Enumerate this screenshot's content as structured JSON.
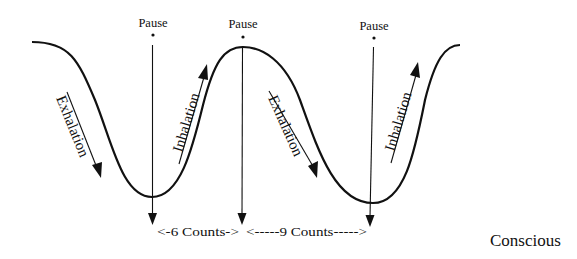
{
  "diagram": {
    "type": "breathing-waveform",
    "caption": "Conscious",
    "pause_labels": [
      "Pause",
      "Pause",
      "Pause"
    ],
    "phase_labels": {
      "exhalation_1": "Exhalation",
      "inhalation_1": "Inhalation",
      "exhalation_2": "Exhalation",
      "inhalation_2": "Inhalation"
    },
    "intervals": [
      {
        "label": "<-6 Counts->",
        "counts": 6
      },
      {
        "label": "<-----9 Counts----->",
        "counts": 9
      }
    ],
    "colors": {
      "line": "#111111",
      "background": "#ffffff"
    }
  }
}
